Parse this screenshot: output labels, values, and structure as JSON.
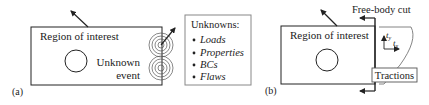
{
  "panel_a": {
    "label": "(a)",
    "region_label": "Region of interest",
    "event_label_line1": "Unknown",
    "event_label_line2": "event",
    "unknowns_box": {
      "title": "Unknowns:",
      "items": [
        "Loads",
        "Properties",
        "BCs",
        "Flaws"
      ]
    }
  },
  "panel_b": {
    "label": "(b)",
    "region_label": "Region of interest",
    "cut_label": "Free-body cut",
    "tractions_label": "Tractions",
    "ty_label": "t",
    "ty_sub": "y",
    "tx_label": "t",
    "tx_sub": "x"
  },
  "colors": {
    "line": "#222222",
    "box_border": "#888888",
    "rings": "#555555"
  }
}
